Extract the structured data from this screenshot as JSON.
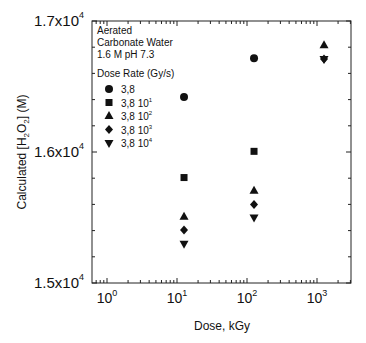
{
  "chart_data": {
    "type": "scatter",
    "title": "",
    "xlabel": "Dose, kGy",
    "ylabel_parts": {
      "pre": "Calculated [H",
      "sub1": "2",
      "mid": "O",
      "sub2": "2",
      "post": "] (M)"
    },
    "ylabel": "Calculated [H2O2] (M)",
    "xscale": "log",
    "xlim": [
      0.6,
      3000
    ],
    "ylim": [
      15000,
      17000
    ],
    "x_ticks": [
      {
        "base": "10",
        "exp": "0",
        "value": 1
      },
      {
        "base": "10",
        "exp": "1",
        "value": 10
      },
      {
        "base": "10",
        "exp": "2",
        "value": 100
      },
      {
        "base": "10",
        "exp": "3",
        "value": 1000
      }
    ],
    "y_ticks": [
      {
        "mant": "1.5x10",
        "exp": "4",
        "value": 15000
      },
      {
        "mant": "1.6x10",
        "exp": "4",
        "value": 16000
      },
      {
        "mant": "1.7x10",
        "exp": "4",
        "value": 17000
      }
    ],
    "grid": false,
    "annotation": [
      "Aerated",
      "Carbonate Water",
      "1.6 M  pH 7.3"
    ],
    "legend_title": "Dose Rate (Gy/s)",
    "legend_position": "upper left",
    "series": [
      {
        "name": "3,8",
        "label_base": "3,8",
        "label_exp": "",
        "marker": "circle",
        "points": [
          [
            12.6,
            16420
          ],
          [
            126,
            16715
          ]
        ]
      },
      {
        "name": "3,8 10^1",
        "label_base": "3,8 10",
        "label_exp": "1",
        "marker": "square",
        "points": [
          [
            12.6,
            15805
          ],
          [
            126,
            16005
          ]
        ]
      },
      {
        "name": "3,8 10^2",
        "label_base": "3,8 10",
        "label_exp": "2",
        "marker": "triangle-up",
        "points": [
          [
            12.6,
            15505
          ],
          [
            126,
            15705
          ],
          [
            1260,
            16815
          ]
        ]
      },
      {
        "name": "3,8 10^3",
        "label_base": "3,8 10",
        "label_exp": "3",
        "marker": "diamond",
        "points": [
          [
            12.6,
            15405
          ],
          [
            126,
            15600
          ],
          [
            1260,
            16710
          ]
        ]
      },
      {
        "name": "3,8 10^4",
        "label_base": "3,8 10",
        "label_exp": "4",
        "marker": "triangle-down",
        "points": [
          [
            12.6,
            15300
          ],
          [
            126,
            15500
          ],
          [
            1260,
            16710
          ]
        ]
      }
    ]
  }
}
